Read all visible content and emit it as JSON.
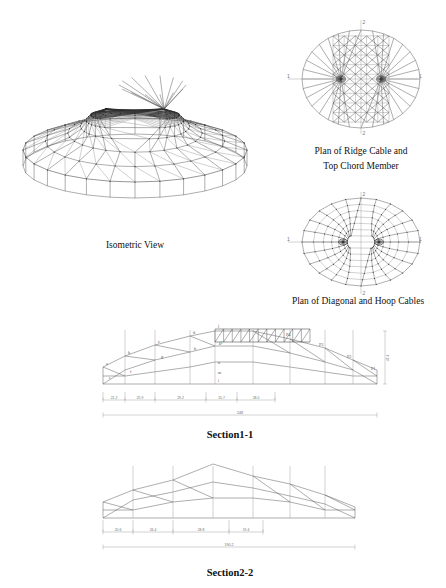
{
  "figure": {
    "units_note": "m"
  },
  "views": {
    "isometric": {
      "caption": "Isometric View"
    },
    "plan_ridge": {
      "caption_line1": "Plan of Ridge Cable and",
      "caption_line2": "Top Chord Member",
      "axis_labels": {
        "left": "1",
        "right": "1",
        "top": "2",
        "bottom": "2"
      }
    },
    "plan_diagonal": {
      "caption": "Plan of Diagonal and Hoop Cables",
      "axis_labels": {
        "left": "1",
        "right": "1",
        "top": "2",
        "bottom": "2"
      }
    },
    "section1": {
      "caption": "Section1-1",
      "node_labels": [
        "a",
        "b",
        "c",
        "d",
        "e",
        "f",
        "g",
        "h",
        "i",
        "j",
        "k",
        "l",
        "m",
        "n"
      ],
      "post_labels": [
        "P1",
        "P2",
        "P3",
        "P4"
      ],
      "dimensions": [
        "21.2",
        "25.9",
        "29.2",
        "15.7",
        "28.0"
      ],
      "overall": "248",
      "height_dim": "47.4"
    },
    "section2": {
      "caption": "Section2-2",
      "dimensions": [
        "20.6",
        "26.4",
        "28.8",
        "19.4"
      ],
      "overall": "190.2"
    }
  },
  "chart_data": {
    "type": "diagram",
    "panels": [
      {
        "name": "Isometric View",
        "kind": "3d-wireframe"
      },
      {
        "name": "Plan of Ridge Cable and Top Chord Member",
        "kind": "plan"
      },
      {
        "name": "Plan of Diagonal and Hoop Cables",
        "kind": "plan"
      },
      {
        "name": "Section1-1",
        "kind": "elevation",
        "span": 248,
        "height": 47.4,
        "segments": [
          21.2,
          25.9,
          29.2,
          15.7,
          28.0
        ]
      },
      {
        "name": "Section2-2",
        "kind": "elevation",
        "span": 190.2,
        "segments": [
          20.6,
          26.4,
          28.8,
          19.4
        ]
      }
    ]
  },
  "colors": {
    "line": "#4a4a4a",
    "light_line": "#8b8b8b",
    "dim_line": "#8d8d8d",
    "text": "#1a1a1a",
    "background": "#ffffff"
  }
}
